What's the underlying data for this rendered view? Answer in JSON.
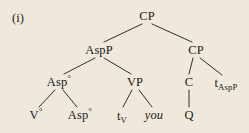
{
  "figure": {
    "example_label": "(i)",
    "caption": "",
    "background_color": "#efe9dd",
    "ink_color": "#1c1a18"
  },
  "tree": {
    "nodes": [
      {
        "id": "cp-root",
        "label": "CP",
        "base": "CP",
        "sup": "",
        "sub": "",
        "italic": false,
        "x": 147,
        "y": 16
      },
      {
        "id": "aspp",
        "label": "AspP",
        "base": "AspP",
        "sup": "",
        "sub": "",
        "italic": false,
        "x": 99,
        "y": 50
      },
      {
        "id": "cp-lower",
        "label": "CP",
        "base": "CP",
        "sup": "",
        "sub": "",
        "italic": false,
        "x": 196,
        "y": 50
      },
      {
        "id": "asp-bar",
        "label": "Asp°",
        "base": "Asp",
        "sup": "°",
        "sub": "",
        "italic": false,
        "x": 59,
        "y": 82
      },
      {
        "id": "vp",
        "label": "VP",
        "base": "VP",
        "sup": "",
        "sub": "",
        "italic": false,
        "x": 135,
        "y": 82
      },
      {
        "id": "c",
        "label": "C",
        "base": "C",
        "sup": "",
        "sub": "",
        "italic": false,
        "x": 189,
        "y": 82
      },
      {
        "id": "t-aspp",
        "label": "tAspP",
        "base": "t",
        "sup": "",
        "sub": "AspP",
        "italic": false,
        "x": 226,
        "y": 83
      },
      {
        "id": "v-head",
        "label": "V°",
        "base": "V",
        "sup": "°",
        "sub": "",
        "italic": false,
        "x": 36,
        "y": 115
      },
      {
        "id": "asp-head",
        "label": "Asp°",
        "base": "Asp",
        "sup": "°",
        "sub": "",
        "italic": false,
        "x": 80,
        "y": 115
      },
      {
        "id": "t-v",
        "label": "tV",
        "base": "t",
        "sup": "",
        "sub": "V",
        "italic": false,
        "x": 122,
        "y": 116
      },
      {
        "id": "you",
        "label": "you",
        "base": "you",
        "sup": "",
        "sub": "",
        "italic": true,
        "x": 154,
        "y": 115
      },
      {
        "id": "q",
        "label": "Q",
        "base": "Q",
        "sup": "",
        "sub": "",
        "italic": false,
        "x": 189,
        "y": 115
      }
    ],
    "branches": [
      {
        "id": "cp-root-to-aspp",
        "from": "cp-root",
        "to": "aspp",
        "x1": 142,
        "y1": 24,
        "x2": 104,
        "y2": 42
      },
      {
        "id": "cp-root-to-cp",
        "from": "cp-root",
        "to": "cp-lower",
        "x1": 152,
        "y1": 24,
        "x2": 192,
        "y2": 42
      },
      {
        "id": "aspp-to-asp-bar",
        "from": "aspp",
        "to": "asp-bar",
        "x1": 95,
        "y1": 58,
        "x2": 64,
        "y2": 74
      },
      {
        "id": "aspp-to-vp",
        "from": "aspp",
        "to": "vp",
        "x1": 104,
        "y1": 58,
        "x2": 131,
        "y2": 74
      },
      {
        "id": "cp-to-c",
        "from": "cp-lower",
        "to": "c",
        "x1": 193,
        "y1": 58,
        "x2": 189,
        "y2": 74
      },
      {
        "id": "cp-to-t-aspp",
        "from": "cp-lower",
        "to": "t-aspp",
        "x1": 200,
        "y1": 58,
        "x2": 222,
        "y2": 75
      },
      {
        "id": "asp-bar-to-v",
        "from": "asp-bar",
        "to": "v-head",
        "x1": 55,
        "y1": 90,
        "x2": 39,
        "y2": 107
      },
      {
        "id": "asp-bar-to-asp",
        "from": "asp-bar",
        "to": "asp-head",
        "x1": 63,
        "y1": 90,
        "x2": 77,
        "y2": 107
      },
      {
        "id": "vp-to-t-v",
        "from": "vp",
        "to": "t-v",
        "x1": 132,
        "y1": 90,
        "x2": 123,
        "y2": 107
      },
      {
        "id": "vp-to-you",
        "from": "vp",
        "to": "you",
        "x1": 139,
        "y1": 90,
        "x2": 152,
        "y2": 107
      },
      {
        "id": "c-to-q",
        "from": "c",
        "to": "q",
        "x1": 189,
        "y1": 90,
        "x2": 189,
        "y2": 107
      }
    ]
  }
}
